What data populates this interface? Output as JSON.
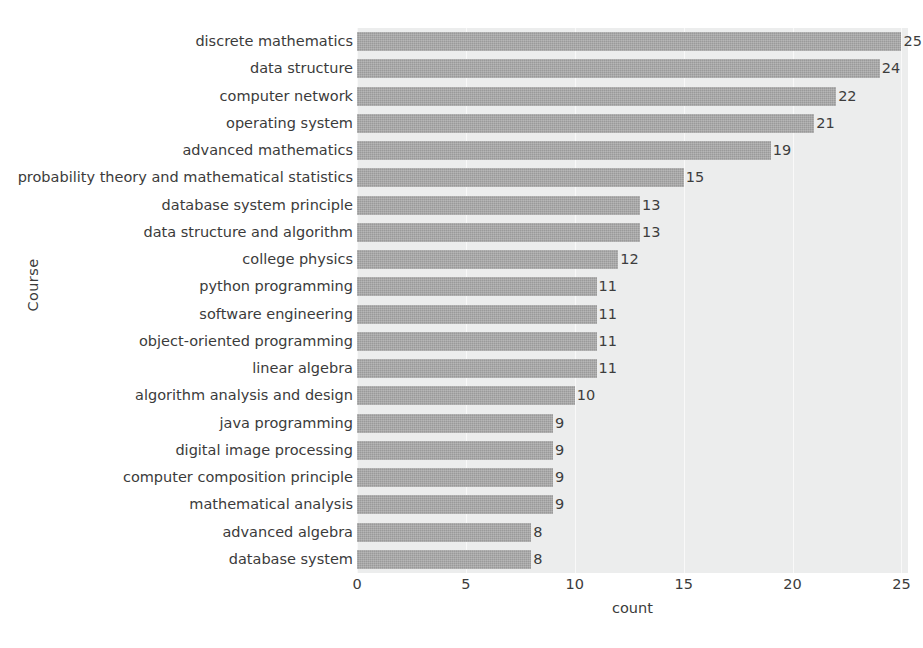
{
  "chart_data": {
    "type": "bar",
    "orientation": "horizontal",
    "title": "",
    "xlabel": "count",
    "ylabel": "Course",
    "xlim": [
      0,
      25.3
    ],
    "xticks": [
      0,
      5,
      10,
      15,
      20,
      25
    ],
    "grid": true,
    "legend": null,
    "bar_color": "#9a9a9a",
    "plot_background": "#eceded",
    "categories": [
      "discrete mathematics",
      "data structure",
      "computer network",
      "operating system",
      "advanced mathematics",
      "probability theory and mathematical statistics",
      "database system principle",
      "data structure and algorithm",
      "college physics",
      "python programming",
      "software engineering",
      "object-oriented programming",
      "linear algebra",
      "algorithm analysis and design",
      "java programming",
      "digital image processing",
      "computer composition principle",
      "mathematical analysis",
      "advanced algebra",
      "database system"
    ],
    "values": [
      25,
      24,
      22,
      21,
      19,
      15,
      13,
      13,
      12,
      11,
      11,
      11,
      11,
      10,
      9,
      9,
      9,
      9,
      8,
      8
    ],
    "value_labels": [
      "25",
      "24",
      "22",
      "21",
      "19",
      "15",
      "13",
      "13",
      "12",
      "11",
      "11",
      "11",
      "11",
      "10",
      "9",
      "9",
      "9",
      "9",
      "8",
      "8"
    ],
    "xtick_labels": [
      "0",
      "5",
      "10",
      "15",
      "20",
      "25"
    ]
  },
  "caption": ""
}
